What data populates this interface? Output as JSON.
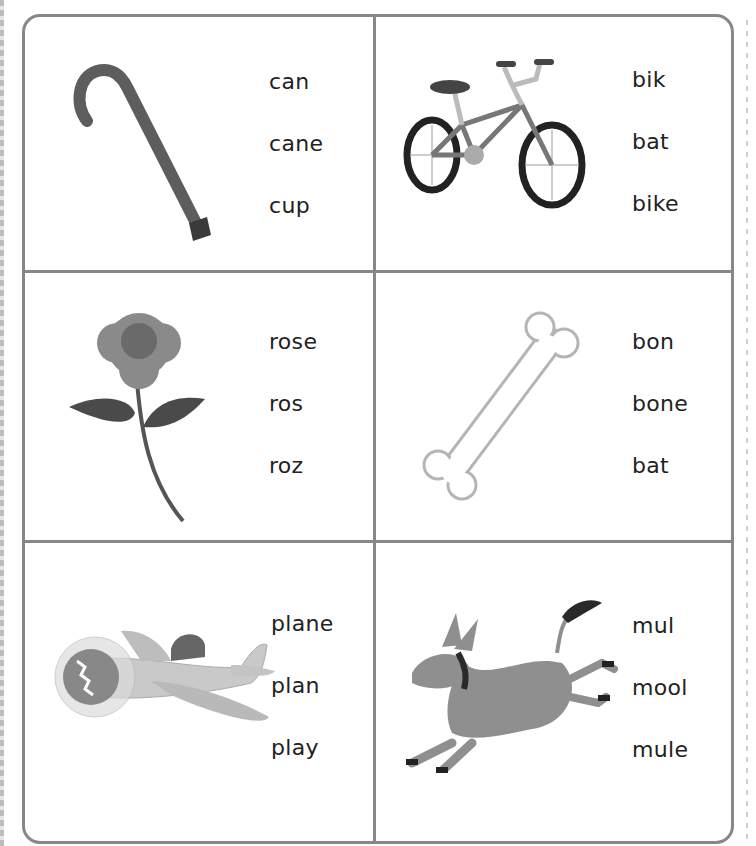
{
  "worksheet": {
    "colors": {
      "border": "#878787",
      "text": "#222222"
    },
    "cells": [
      {
        "picture": "cane-icon",
        "options": [
          "can",
          "cane",
          "cup"
        ]
      },
      {
        "picture": "bike-icon",
        "options": [
          "bik",
          "bat",
          "bike"
        ]
      },
      {
        "picture": "rose-icon",
        "options": [
          "rose",
          "ros",
          "roz"
        ]
      },
      {
        "picture": "bone-icon",
        "options": [
          "bon",
          "bone",
          "bat"
        ]
      },
      {
        "picture": "plane-icon",
        "options": [
          "plane",
          "plan",
          "play"
        ]
      },
      {
        "picture": "mule-icon",
        "options": [
          "mul",
          "mool",
          "mule"
        ]
      }
    ]
  }
}
